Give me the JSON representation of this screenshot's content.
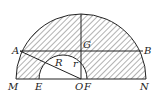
{
  "diagram": {
    "type": "geometry",
    "labels": {
      "A": "A",
      "B": "B",
      "G": "G",
      "M": "M",
      "E": "E",
      "O": "O",
      "F": "F",
      "N": "N",
      "R": "R",
      "r": "r"
    },
    "colors": {
      "stroke": "#222222",
      "hatch": "#555555",
      "background": "#ffffff"
    }
  }
}
